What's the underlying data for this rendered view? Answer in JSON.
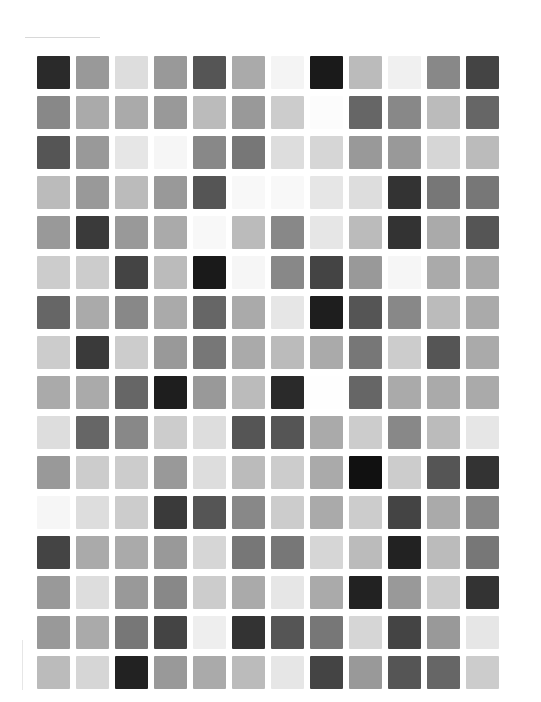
{
  "grid": {
    "rows": 16,
    "cols": 12,
    "cells": [
      [
        "#2a2a2a",
        "#999999",
        "#dddddd",
        "#999999",
        "#555555",
        "#aaaaaa",
        "#f4f4f4",
        "#1a1a1a",
        "#bbbbbb",
        "#f0f0f0",
        "#888888",
        "#444444"
      ],
      [
        "#888888",
        "#aaaaaa",
        "#aaaaaa",
        "#999999",
        "#bbbbbb",
        "#999999",
        "#cccccc",
        "#fcfcfc",
        "#666666",
        "#888888",
        "#bbbbbb",
        "#666666"
      ],
      [
        "#555555",
        "#999999",
        "#e6e6e6",
        "#f6f6f6",
        "#888888",
        "#777777",
        "#dddddd",
        "#d6d6d6",
        "#999999",
        "#999999",
        "#d6d6d6",
        "#bbbbbb"
      ],
      [
        "#bbbbbb",
        "#999999",
        "#bbbbbb",
        "#999999",
        "#555555",
        "#f8f8f8",
        "#f8f8f8",
        "#e6e6e6",
        "#dddddd",
        "#333333",
        "#777777",
        "#777777"
      ],
      [
        "#999999",
        "#3a3a3a",
        "#999999",
        "#aaaaaa",
        "#f8f8f8",
        "#bbbbbb",
        "#888888",
        "#e6e6e6",
        "#bbbbbb",
        "#333333",
        "#aaaaaa",
        "#555555"
      ],
      [
        "#cccccc",
        "#cccccc",
        "#444444",
        "#bbbbbb",
        "#1a1a1a",
        "#f6f6f6",
        "#888888",
        "#444444",
        "#999999",
        "#f6f6f6",
        "#aaaaaa",
        "#aaaaaa"
      ],
      [
        "#666666",
        "#aaaaaa",
        "#888888",
        "#aaaaaa",
        "#666666",
        "#aaaaaa",
        "#e6e6e6",
        "#1e1e1e",
        "#555555",
        "#888888",
        "#bbbbbb",
        "#aaaaaa"
      ],
      [
        "#cccccc",
        "#3a3a3a",
        "#cccccc",
        "#999999",
        "#777777",
        "#aaaaaa",
        "#bbbbbb",
        "#aaaaaa",
        "#777777",
        "#cccccc",
        "#555555",
        "#aaaaaa"
      ],
      [
        "#aaaaaa",
        "#aaaaaa",
        "#666666",
        "#1e1e1e",
        "#999999",
        "#bbbbbb",
        "#2a2a2a",
        "#fefefe",
        "#666666",
        "#aaaaaa",
        "#aaaaaa",
        "#aaaaaa"
      ],
      [
        "#dddddd",
        "#666666",
        "#888888",
        "#cccccc",
        "#dddddd",
        "#555555",
        "#555555",
        "#aaaaaa",
        "#cccccc",
        "#888888",
        "#bbbbbb",
        "#e6e6e6"
      ],
      [
        "#999999",
        "#cccccc",
        "#cccccc",
        "#999999",
        "#dddddd",
        "#bbbbbb",
        "#cccccc",
        "#aaaaaa",
        "#111111",
        "#cccccc",
        "#555555",
        "#333333"
      ],
      [
        "#f6f6f6",
        "#dddddd",
        "#cccccc",
        "#3a3a3a",
        "#555555",
        "#888888",
        "#cccccc",
        "#aaaaaa",
        "#cccccc",
        "#444444",
        "#aaaaaa",
        "#888888"
      ],
      [
        "#444444",
        "#aaaaaa",
        "#aaaaaa",
        "#999999",
        "#d6d6d6",
        "#777777",
        "#777777",
        "#d6d6d6",
        "#bbbbbb",
        "#222222",
        "#bbbbbb",
        "#777777"
      ],
      [
        "#999999",
        "#dddddd",
        "#999999",
        "#888888",
        "#cccccc",
        "#aaaaaa",
        "#e6e6e6",
        "#aaaaaa",
        "#222222",
        "#999999",
        "#cccccc",
        "#333333"
      ],
      [
        "#999999",
        "#aaaaaa",
        "#777777",
        "#444444",
        "#eeeeee",
        "#333333",
        "#555555",
        "#777777",
        "#d6d6d6",
        "#444444",
        "#999999",
        "#e6e6e6"
      ],
      [
        "#bbbbbb",
        "#d6d6d6",
        "#222222",
        "#999999",
        "#aaaaaa",
        "#bbbbbb",
        "#e6e6e6",
        "#444444",
        "#999999",
        "#555555",
        "#666666",
        "#cccccc"
      ]
    ]
  }
}
